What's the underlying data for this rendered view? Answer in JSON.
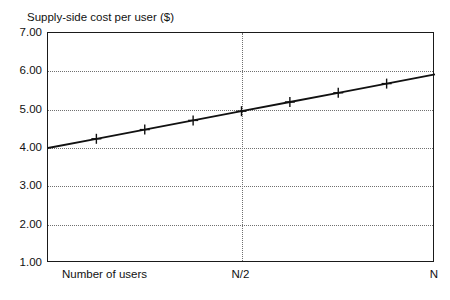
{
  "chart_data": {
    "type": "line",
    "title": "Supply-side cost per user ($)",
    "xlabel": "Number of users",
    "ylabel": "",
    "ylim": [
      1.0,
      7.0
    ],
    "xlim": [
      0,
      1
    ],
    "grid": true,
    "legend": false,
    "ytick_labels": [
      "7.00",
      "6.00",
      "5.00",
      "4.00",
      "3.00",
      "2.00",
      "1.00"
    ],
    "ytick_values": [
      7.0,
      6.0,
      5.0,
      4.0,
      3.0,
      2.0,
      1.0
    ],
    "xtick_labels": [
      "N/2",
      "N"
    ],
    "xtick_values": [
      0.5,
      1.0
    ],
    "series": [
      {
        "name": "Supply-side cost per user",
        "marker": "plus",
        "x": [
          0.0,
          0.125,
          0.25,
          0.375,
          0.5,
          0.625,
          0.75,
          0.875,
          1.0
        ],
        "values": [
          4.0,
          4.24,
          4.48,
          4.72,
          4.96,
          5.2,
          5.44,
          5.68,
          5.92
        ]
      }
    ],
    "marker_points": [
      {
        "x": 0.125,
        "y": 4.24
      },
      {
        "x": 0.25,
        "y": 4.48
      },
      {
        "x": 0.375,
        "y": 4.72
      },
      {
        "x": 0.5,
        "y": 4.96
      },
      {
        "x": 0.625,
        "y": 5.2
      },
      {
        "x": 0.75,
        "y": 5.44
      },
      {
        "x": 0.875,
        "y": 5.68
      }
    ],
    "colors": {
      "line": "#111111",
      "grid": "#707070",
      "axis": "#1a1a1a",
      "background": "#ffffff"
    }
  }
}
